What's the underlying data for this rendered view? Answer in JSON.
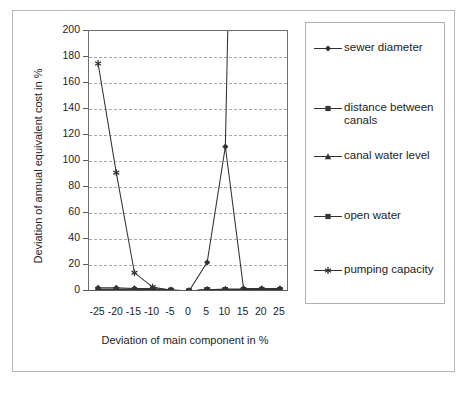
{
  "chart_data": {
    "type": "line",
    "title": "",
    "xlabel": "Deviation of main component in %",
    "ylabel": "Deviation of annual equivalent cost in %",
    "x": [
      -25,
      -20,
      -15,
      -10,
      -5,
      0,
      5,
      10,
      15,
      20,
      25
    ],
    "xlim": [
      -27.5,
      27.5
    ],
    "ylim": [
      0,
      200
    ],
    "xticks": [
      "-25",
      "-20",
      "-15",
      "-10",
      "-5",
      "0",
      "5",
      "10",
      "15",
      "20",
      "25"
    ],
    "yticks": [
      "0",
      "20",
      "40",
      "60",
      "80",
      "100",
      "120",
      "140",
      "160",
      "180",
      "200"
    ],
    "grid": "horizontal-dashed",
    "legend_position": "right",
    "series": [
      {
        "name": "sewer diameter",
        "marker": "diamond",
        "values": [
          2.5,
          2.5,
          2.0,
          2.0,
          1.0,
          0.0,
          22.0,
          111.0,
          2.0,
          2.0,
          2.0
        ],
        "note": "rises off the top of the chart beyond 10%"
      },
      {
        "name": "distance between canals",
        "marker": "square",
        "values": [
          1.0,
          1.0,
          1.0,
          1.0,
          0.5,
          0.0,
          1.0,
          1.0,
          1.0,
          1.0,
          1.0
        ]
      },
      {
        "name": "canal water level",
        "marker": "triangle",
        "values": [
          1.5,
          1.5,
          1.5,
          1.0,
          0.5,
          0.0,
          1.0,
          1.5,
          1.5,
          1.5,
          1.5
        ]
      },
      {
        "name": "open water",
        "marker": "square",
        "values": [
          1.0,
          1.0,
          1.0,
          1.0,
          0.5,
          0.0,
          1.0,
          1.0,
          1.0,
          1.0,
          1.0
        ]
      },
      {
        "name": "pumping capacity",
        "marker": "asterisk",
        "values": [
          175.0,
          91.0,
          14.0,
          3.0,
          0.5,
          0.0,
          1.0,
          1.0,
          1.0,
          1.0,
          1.0
        ]
      }
    ]
  },
  "axes": {
    "y_title": "Deviation of annual equivalent cost in %",
    "x_title": "Deviation of main component in %",
    "y_ticks": [
      "200",
      "180",
      "160",
      "140",
      "120",
      "100",
      "80",
      "60",
      "40",
      "20",
      "0"
    ],
    "x_ticks": [
      "-25",
      "-20",
      "-15",
      "-10",
      "-5",
      "0",
      "5",
      "10",
      "15",
      "20",
      "25"
    ]
  },
  "legend": {
    "items": [
      {
        "label": "sewer diameter",
        "marker": "diamond-icon"
      },
      {
        "label": "distance between canals",
        "marker": "square-icon"
      },
      {
        "label": "canal water level",
        "marker": "triangle-icon"
      },
      {
        "label": "open water",
        "marker": "square-icon"
      },
      {
        "label": "pumping capacity",
        "marker": "asterisk-icon"
      }
    ]
  },
  "colors": {
    "series_line": "#333333",
    "grid": "#a9a9a9",
    "axis": "#5a5a5a",
    "frame": "#b9b9b9",
    "text": "#1d1d1d"
  },
  "caption": ""
}
